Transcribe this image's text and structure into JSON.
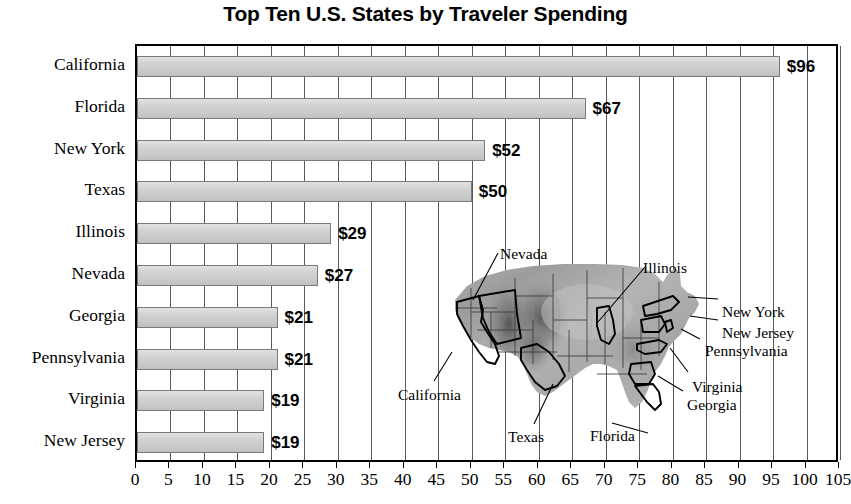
{
  "chart_data": {
    "type": "bar",
    "orientation": "horizontal",
    "title": "Top Ten U.S. States by Traveler Spending",
    "xlabel": "",
    "ylabel": "",
    "xlim": [
      0,
      105
    ],
    "xtick_step": 5,
    "grid": true,
    "legend": "none",
    "value_prefix": "$",
    "categories": [
      "California",
      "Florida",
      "New York",
      "Texas",
      "Illinois",
      "Nevada",
      "Georgia",
      "Pennsylvania",
      "Virginia",
      "New Jersey"
    ],
    "values": [
      96,
      67,
      52,
      50,
      29,
      27,
      21,
      21,
      19,
      19
    ],
    "value_labels": [
      "$96",
      "$67",
      "$52",
      "$50",
      "$29",
      "$27",
      "$21",
      "$21",
      "$19",
      "$19"
    ],
    "xticks": [
      0,
      5,
      10,
      15,
      20,
      25,
      30,
      35,
      40,
      45,
      50,
      55,
      60,
      65,
      70,
      75,
      80,
      85,
      90,
      95,
      100,
      105
    ],
    "xtick_labels": [
      "0",
      "5",
      "10",
      "15",
      "20",
      "25",
      "30",
      "35",
      "40",
      "45",
      "50",
      "55",
      "60",
      "65",
      "70",
      "75",
      "80",
      "85",
      "90",
      "95",
      "100",
      "105"
    ],
    "bar_fill_color": "#d0d0d0",
    "bar_edge_color": "#7a7a7a",
    "gridline_color": "#585858",
    "axis_color": "#000000",
    "background_color": "#ffffff"
  },
  "map_inset": {
    "name": "united-states-relief-map",
    "description": "Grayscale shaded-relief map of the contiguous United States with the ten highlighted states outlined",
    "callouts": [
      {
        "label": "Nevada",
        "x": 500,
        "y": 245
      },
      {
        "label": "Illinois",
        "x": 643,
        "y": 259
      },
      {
        "label": "New York",
        "x": 722,
        "y": 303
      },
      {
        "label": "New Jersey",
        "x": 722,
        "y": 324
      },
      {
        "label": "Pennsylvania",
        "x": 705,
        "y": 342
      },
      {
        "label": "Virginia",
        "x": 692,
        "y": 378
      },
      {
        "label": "Georgia",
        "x": 687,
        "y": 396
      },
      {
        "label": "California",
        "x": 398,
        "y": 386
      },
      {
        "label": "Texas",
        "x": 508,
        "y": 428
      },
      {
        "label": "Florida",
        "x": 590,
        "y": 427
      }
    ]
  }
}
